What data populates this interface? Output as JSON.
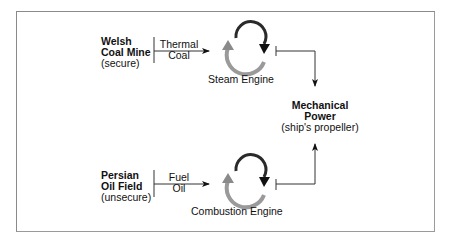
{
  "diagram": {
    "sources": [
      {
        "name_line1": "Welsh",
        "name_line2": "Coal Mine",
        "status": "(secure)",
        "fuel_line1": "Thermal",
        "fuel_line2": "Coal",
        "engine": "Steam Engine"
      },
      {
        "name_line1": "Persian",
        "name_line2": "Oil Field",
        "status": "(unsecure)",
        "fuel_line1": "Fuel",
        "fuel_line2": "Oil",
        "engine": "Combustion Engine"
      }
    ],
    "output": {
      "line1": "Mechanical",
      "line2": "Power",
      "line3": "(ship's propeller)"
    }
  },
  "colors": {
    "frame": "#8a8a8a",
    "line": "#333333",
    "cycle_dark": "#2a2a2a",
    "cycle_light": "#9a9a9a"
  }
}
